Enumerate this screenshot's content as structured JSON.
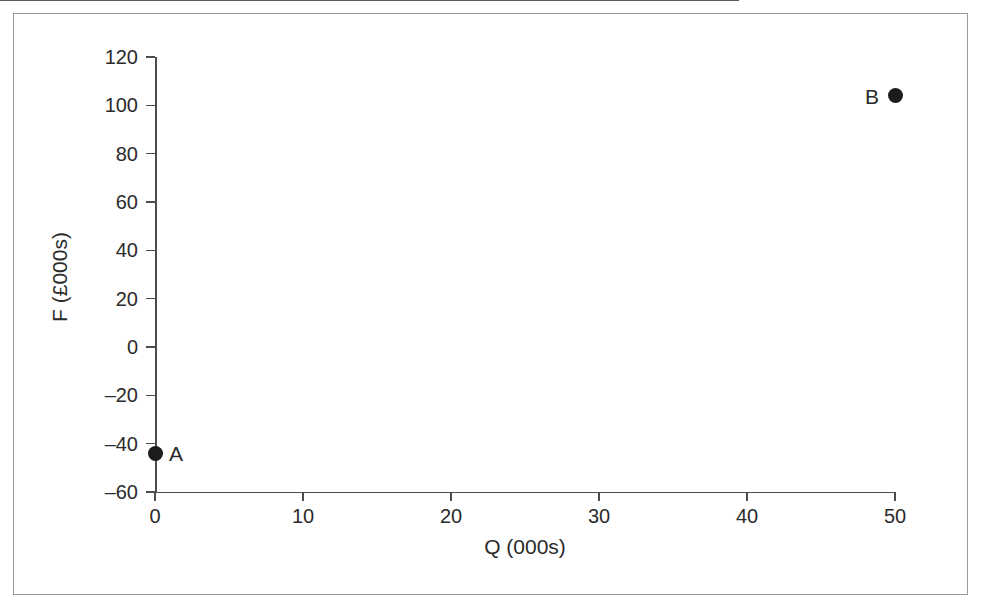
{
  "chart_data": {
    "type": "scatter",
    "title": "",
    "xlabel": "Q (000s)",
    "ylabel": "F (£000s)",
    "xlim": [
      0,
      50
    ],
    "ylim": [
      -60,
      120
    ],
    "xticks": [
      "0",
      "10",
      "20",
      "30",
      "40",
      "50"
    ],
    "xtick_values": [
      0,
      10,
      20,
      30,
      40,
      50
    ],
    "yticks": [
      "120",
      "100",
      "80",
      "60",
      "40",
      "20",
      "0",
      "‒20",
      "‒40",
      "‒60"
    ],
    "ytick_values": [
      120,
      100,
      80,
      60,
      40,
      20,
      0,
      -20,
      -40,
      -60
    ],
    "grid": false,
    "legend": "none",
    "points": [
      {
        "label": "A",
        "x": 0,
        "y": -44,
        "label_side": "right"
      },
      {
        "label": "B",
        "x": 50,
        "y": 104,
        "label_side": "left"
      }
    ],
    "reference_lines": [
      {
        "orientation": "horizontal",
        "value": 0,
        "from_x": 0,
        "to_x": 50
      }
    ],
    "colors": {
      "marker": "#1c1c1c",
      "axis": "#4d4d4d",
      "zero_line": "#5a5a5a",
      "frame": "#9a9a9a",
      "text": "#2b2b2b",
      "background": "#ffffff"
    }
  }
}
